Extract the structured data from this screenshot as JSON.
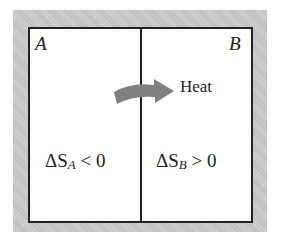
{
  "diagram": {
    "regions": [
      {
        "id": "A",
        "label": "A"
      },
      {
        "id": "B",
        "label": "B"
      }
    ],
    "arrow_label": "Heat",
    "equations": {
      "a": {
        "delta": "ΔS",
        "sub": "A",
        "relation": " < 0"
      },
      "b": {
        "delta": "ΔS",
        "sub": "B",
        "relation": " > 0"
      }
    },
    "colors": {
      "frame": "#c8c8c8",
      "border": "#222222",
      "arrow": "#808080",
      "background": "#ffffff"
    }
  }
}
